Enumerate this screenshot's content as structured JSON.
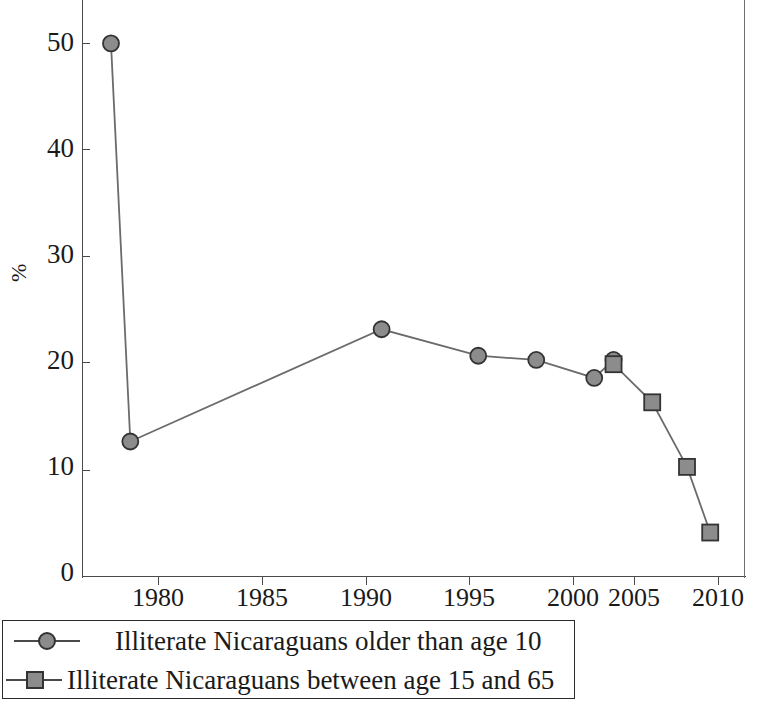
{
  "chart_data": {
    "type": "line",
    "title": "",
    "xlabel": "",
    "ylabel": "%",
    "xlim": [
      1977.5,
      2011.8
    ],
    "ylim": [
      0,
      54.5
    ],
    "xticks": [
      1980,
      1985,
      1990,
      1995,
      2000,
      2005,
      2010
    ],
    "xtick_labels": [
      "1980",
      "1985",
      "1990",
      "1995",
      "2000",
      "2005",
      "2010"
    ],
    "yticks": [
      0,
      10,
      20,
      30,
      40,
      50
    ],
    "ytick_labels": [
      "0",
      "10",
      "20",
      "30",
      "40",
      "50"
    ],
    "grid": false,
    "legend_position": "below-axes",
    "series": [
      {
        "name": "Illiterate Nicaraguans older than age 10",
        "marker": "circle",
        "color": "#8c8c8c",
        "line_color": "#6b6b6b",
        "points": [
          {
            "x": 1979,
            "y": 50.4
          },
          {
            "x": 1980,
            "y": 12.8
          },
          {
            "x": 1993,
            "y": 23.4
          },
          {
            "x": 1998,
            "y": 20.9
          },
          {
            "x": 2001,
            "y": 20.5
          },
          {
            "x": 2004,
            "y": 18.8
          },
          {
            "x": 2005,
            "y": 20.5
          }
        ]
      },
      {
        "name": "Illiterate Nicaraguans between age 15 and 65",
        "marker": "square",
        "color": "#8c8c8c",
        "line_color": "#6b6b6b",
        "points": [
          {
            "x": 2005,
            "y": 20.1
          },
          {
            "x": 2007,
            "y": 16.5
          },
          {
            "x": 2008.8,
            "y": 10.4
          },
          {
            "x": 2010,
            "y": 4.2
          }
        ]
      }
    ]
  },
  "legend": {
    "items": [
      {
        "label": "Illiterate Nicaraguans older than age 10",
        "marker": "circle"
      },
      {
        "label": "Illiterate Nicaraguans between age 15 and 65",
        "marker": "square"
      }
    ]
  },
  "colors": {
    "axis": "#4a4a4a",
    "marker_fill": "#8c8c8c",
    "marker_stroke": "#333333",
    "line": "#6b6b6b",
    "legend_border": "#2b2b2b",
    "text": "#1a1a1a",
    "background": "#ffffff"
  }
}
